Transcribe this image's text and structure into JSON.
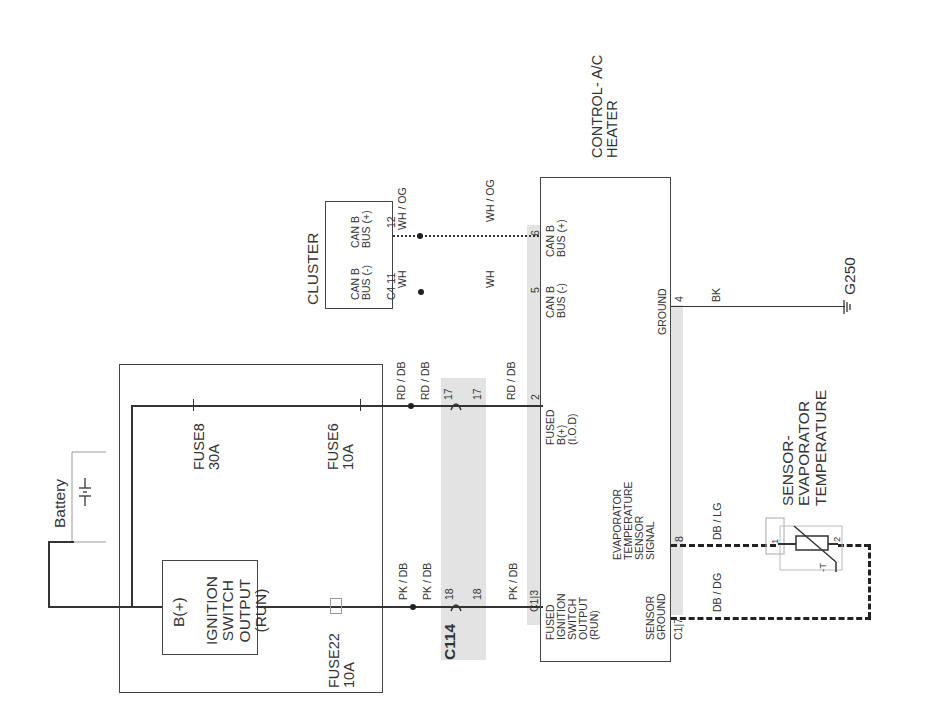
{
  "diagram": {
    "type": "automotive wiring schematic",
    "orientation": "rotated 90deg counter-clockwise",
    "modules": {
      "control": {
        "title": "CONTROL- A/C\nHEATER",
        "pins": {
          "can_plus": {
            "pin": "6",
            "label": "CAN B\nBUS (+)"
          },
          "can_minus": {
            "pin": "5",
            "label": "CAN B\nBUS (-)"
          },
          "ground": {
            "pin": "4",
            "label": "GROUND"
          },
          "fused_bplus": {
            "pin": "2",
            "label": "FUSED\nB(+)\n(I.O.D)"
          },
          "evap_signal": {
            "pin": "8",
            "label": "EVAPORATOR\nTEMPERATURE\nSENSOR\nSIGNAL"
          },
          "fused_ign": {
            "pin": "3",
            "connector": "C1",
            "label": "FUSED\nIGNITION\nSWITCH\nOUTPUT\n(RUN)"
          },
          "sensor_ground": {
            "pin": "7",
            "connector": "C1",
            "label": "SENSOR\nGROUND"
          }
        }
      },
      "cluster": {
        "title": "CLUSTER",
        "connector": "C4",
        "pins": {
          "can_minus": {
            "pin": "11",
            "label": "CAN B\nBUS (-)"
          },
          "can_plus": {
            "pin": "12",
            "label": "CAN B\nBUS (+)"
          }
        }
      },
      "ignition": {
        "label": "IGNITION\nSWITCH\nOUTPUT\n(RUN)",
        "input": "B(+)"
      },
      "battery": {
        "label": "Battery",
        "symbol": "-|I|-"
      },
      "sensor": {
        "title": "SENSOR-\nEVAPORATOR\nTEMPERATURE",
        "pin1": "1",
        "pin2": "2",
        "symbol": "-T"
      },
      "ground": {
        "label": "G250"
      }
    },
    "fuses": [
      {
        "name": "FUSE8",
        "rating": "30A"
      },
      {
        "name": "FUSE6",
        "rating": "10A"
      },
      {
        "name": "FUSE22",
        "rating": "10A"
      }
    ],
    "connector_c114": {
      "label": "C114",
      "pins": [
        "17",
        "18"
      ]
    },
    "wires": {
      "can_plus_cluster": "WH / OG",
      "can_plus_control": "WH / OG",
      "can_minus_cluster": "WH",
      "can_minus_control": "WH",
      "ground": "BK",
      "fused_bplus_a": "RD / DB",
      "fused_bplus_b": "RD / DB",
      "fused_bplus_c": "RD / DB",
      "ign_a": "PK / DB",
      "ign_b": "PK / DB",
      "ign_c": "PK / DB",
      "evap_signal": "DB / LG",
      "sensor_ground": "DB / DG"
    }
  }
}
